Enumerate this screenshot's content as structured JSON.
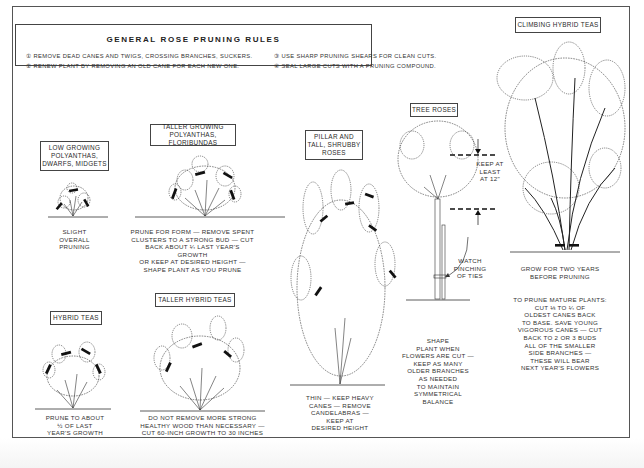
{
  "title": "GENERAL ROSE PRUNING RULES",
  "rules": [
    {
      "num": "①",
      "text": "REMOVE DEAD CANES AND TWIGS, CROSSING BRANCHES, SUCKERS."
    },
    {
      "num": "②",
      "text": "RENEW PLANT BY REMOVING AN OLD CANE FOR EACH NEW ONE."
    },
    {
      "num": "③",
      "text": "USE SHARP PRUNING SHEARS FOR CLEAN CUTS."
    },
    {
      "num": "④",
      "text": "SEAL LARGE CUTS WITH A PRUNING COMPOUND."
    }
  ],
  "sections": {
    "low_growing": {
      "label": "LOW GROWING\nPOLYANTHAS,\nDWARFS, MIDGETS",
      "caption": "SLIGHT\nOVERALL\nPRUNING"
    },
    "taller_polyanthas": {
      "label": "TALLER GROWING\nPOLYANTHAS, FLORIBUNDAS",
      "caption": "PRUNE FOR FORM — REMOVE SPENT\nCLUSTERS TO A STRONG BUD — CUT\nBACK ABOUT ¼ LAST YEAR'S GROWTH\nOR KEEP AT DESIRED HEIGHT —\nSHAPE PLANT AS YOU PRUNE"
    },
    "hybrid_teas": {
      "label": "HYBRID TEAS",
      "caption": "PRUNE TO ABOUT\n½ OF LAST\nYEAR'S GROWTH"
    },
    "taller_hybrid_teas": {
      "label": "TALLER HYBRID TEAS",
      "caption": "DO NOT REMOVE MORE STRONG\nHEALTHY WOOD THAN NECESSARY —\nCUT 60-INCH GROWTH TO 30 INCHES"
    },
    "pillar_roses": {
      "label": "PILLAR AND\nTALL, SHRUBBY\nROSES",
      "caption": "THIN — KEEP HEAVY\nCANES — REMOVE\nCANDELABRAS —\nKEEP AT\nDESIRED HEIGHT"
    },
    "tree_roses": {
      "label": "TREE ROSES",
      "height_note": "KEEP AT\nLEAST\nAT 12\"",
      "tie_note": "WATCH\nPINCHING\nOF TIES",
      "caption": "SHAPE\nPLANT WHEN\nFLOWERS ARE CUT —\nKEEP AS MANY\nOLDER BRANCHES\nAS NEEDED\nTO MAINTAIN\nSYMMETRICAL\nBALANCE"
    },
    "climbing_hybrid_teas": {
      "label": "CLIMBING HYBRID TEAS",
      "caption_1": "GROW FOR TWO YEARS\nBEFORE PRUNING",
      "caption_2": "TO PRUNE MATURE PLANTS:\nCUT ⅓ TO ¼ OF\nOLDEST CANES BACK\nTO BASE. SAVE YOUNG\nVIGOROUS CANES — CUT\nBACK TO 2 OR 3 BUDS\nALL OF THE SMALLER\nSIDE BRANCHES —\nTHESE WILL BEAR\nNEXT YEAR'S FLOWERS"
    }
  },
  "icons": {
    "cut_mark": "pruning-cut-mark",
    "arrow": "dimension-arrow"
  },
  "colors": {
    "ink": "#2a2a2a",
    "paper": "#ffffff",
    "cut_mark": "#111111"
  }
}
